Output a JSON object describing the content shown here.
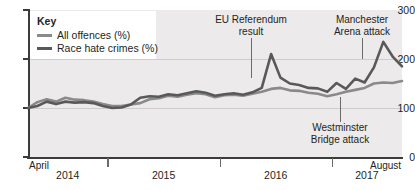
{
  "chart_data": {
    "type": "line",
    "title": "",
    "xlabel": "",
    "ylabel": "",
    "ylim": [
      0,
      300
    ],
    "yticks": [
      0,
      100,
      200,
      300
    ],
    "grid": true,
    "gridlines_at": [
      100,
      200
    ],
    "legend_position": "top-left",
    "x_start_label": "April",
    "x_end_label": "August",
    "categories": [
      "Apr 2014",
      "May 2014",
      "Jun 2014",
      "Jul 2014",
      "Aug 2014",
      "Sep 2014",
      "Oct 2014",
      "Nov 2014",
      "Dec 2014",
      "Jan 2015",
      "Feb 2015",
      "Mar 2015",
      "Apr 2015",
      "May 2015",
      "Jun 2015",
      "Jul 2015",
      "Aug 2015",
      "Sep 2015",
      "Oct 2015",
      "Nov 2015",
      "Dec 2015",
      "Jan 2016",
      "Feb 2016",
      "Mar 2016",
      "Apr 2016",
      "May 2016",
      "Jun 2016",
      "Jul 2016",
      "Aug 2016",
      "Sep 2016",
      "Oct 2016",
      "Nov 2016",
      "Dec 2016",
      "Jan 2017",
      "Feb 2017",
      "Mar 2017",
      "Apr 2017",
      "May 2017",
      "Jun 2017",
      "Jul 2017",
      "Aug 2017"
    ],
    "series": [
      {
        "name": "All offences (%)",
        "color": "#8a8a8a",
        "values": [
          100,
          112,
          118,
          113,
          121,
          117,
          116,
          113,
          108,
          104,
          104,
          107,
          110,
          118,
          120,
          125,
          123,
          127,
          130,
          128,
          122,
          126,
          127,
          125,
          129,
          133,
          139,
          141,
          136,
          135,
          131,
          129,
          124,
          128,
          133,
          137,
          141,
          150,
          152,
          151,
          155
        ]
      },
      {
        "name": "Race hate crimes (%)",
        "color": "#595959",
        "values": [
          100,
          104,
          113,
          108,
          113,
          111,
          112,
          110,
          104,
          100,
          101,
          107,
          121,
          124,
          123,
          128,
          126,
          130,
          134,
          131,
          125,
          128,
          130,
          127,
          132,
          141,
          210,
          162,
          150,
          147,
          141,
          140,
          133,
          151,
          139,
          160,
          152,
          183,
          235,
          205,
          185
        ]
      }
    ],
    "legend": [
      {
        "label": "All offences (%)",
        "color": "#8a8a8a"
      },
      {
        "label": "Race hate crimes (%)",
        "color": "#595959"
      }
    ],
    "annotations": [
      {
        "text_line1": "EU Referendum",
        "text_line2": "result",
        "position": "above"
      },
      {
        "text_line1": "Manchester",
        "text_line2": "Arena attack",
        "position": "above"
      },
      {
        "text_line1": "Westminster",
        "text_line2": "Bridge attack",
        "position": "below"
      }
    ],
    "x_year_labels": [
      "2014",
      "2015",
      "2016",
      "2017"
    ]
  },
  "legend": {
    "title": "Key",
    "item0_label": "All offences (%)",
    "item1_label": "Race hate crimes (%)"
  },
  "yaxis": {
    "t0": "0",
    "t1": "100",
    "t2": "200",
    "t3": "300"
  },
  "xaxis": {
    "start": "April",
    "end": "August",
    "y0": "2014",
    "y1": "2015",
    "y2": "2016",
    "y3": "2017"
  },
  "annotations": {
    "eu_line1": "EU Referendum",
    "eu_line2": "result",
    "manchester_line1": "Manchester",
    "manchester_line2": "Arena attack",
    "westminster_line1": "Westminster",
    "westminster_line2": "Bridge attack"
  }
}
